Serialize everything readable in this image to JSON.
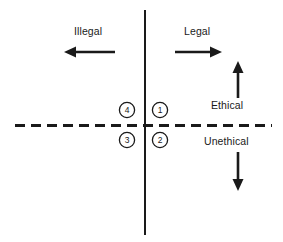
{
  "diagram": {
    "type": "quadrant-axes",
    "background_color": "#ffffff",
    "line_color": "#1a1a1a",
    "text_color": "#1a1a1a",
    "axes": {
      "vertical": {
        "name": "legality-axis",
        "style": "solid",
        "x": 145,
        "y_start": 10,
        "y_end": 235,
        "stroke_width": 2
      },
      "horizontal": {
        "name": "ethics-axis",
        "style": "dashed",
        "y": 125,
        "x_start": 15,
        "x_end": 272,
        "stroke_width": 3,
        "dash": "10 6"
      }
    },
    "direction_labels": [
      {
        "id": "illegal",
        "text": "Illegal",
        "arrow": "left",
        "arrow_x1": 115,
        "arrow_x2": 66,
        "arrow_y": 52
      },
      {
        "id": "legal",
        "text": "Legal",
        "arrow": "right",
        "arrow_x1": 175,
        "arrow_x2": 221,
        "arrow_y": 52
      },
      {
        "id": "ethical",
        "text": "Ethical",
        "arrow": "up",
        "arrow_x": 238,
        "arrow_y1": 98,
        "arrow_y2": 62
      },
      {
        "id": "unethical",
        "text": "Unethical",
        "arrow": "down",
        "arrow_x": 238,
        "arrow_y1": 152,
        "arrow_y2": 191
      }
    ],
    "quadrant_markers": [
      {
        "id": "marker-1",
        "label": "1",
        "cx": 160,
        "cy": 110,
        "r": 8
      },
      {
        "id": "marker-2",
        "label": "2",
        "cx": 160,
        "cy": 140,
        "r": 8
      },
      {
        "id": "marker-3",
        "label": "3",
        "cx": 127,
        "cy": 140,
        "r": 8
      },
      {
        "id": "marker-4",
        "label": "4",
        "cx": 127,
        "cy": 110,
        "r": 8
      }
    ]
  }
}
